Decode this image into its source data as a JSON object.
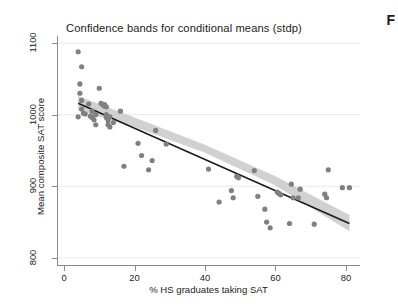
{
  "page": {
    "caption_fragment": "F"
  },
  "figure": {
    "title": "Confidence bands for conditional means (stdp)"
  },
  "chart_data": {
    "type": "scatter",
    "title": "Confidence bands for conditional means (stdp)",
    "xlabel": "% HS graduates taking SAT",
    "ylabel": "Mean composite SAT score",
    "xlim": [
      -2,
      84
    ],
    "ylim": [
      790,
      1110
    ],
    "xticks": [
      0,
      20,
      40,
      60,
      80
    ],
    "yticks": [
      800,
      900,
      1000,
      1100
    ],
    "xtick_labels": [
      "0",
      "20",
      "40",
      "60",
      "80"
    ],
    "ytick_labels": [
      "800",
      "900",
      "1000",
      "1100"
    ],
    "grid": "horizontal",
    "legend": "none",
    "marker_color": "#808080",
    "marker_size": 4,
    "fit_line_color": "#1a1a1a",
    "ci_band_color": "#c9c9c9",
    "gridline_color": "#e9e9e9",
    "axis_color": "#8a8a8a",
    "points": [
      [
        4.0,
        1088
      ],
      [
        5.0,
        1067
      ],
      [
        4.5,
        1043
      ],
      [
        4.5,
        1030
      ],
      [
        4.0,
        997
      ],
      [
        5.0,
        1020
      ],
      [
        5.0,
        1008
      ],
      [
        5.5,
        1002
      ],
      [
        6.0,
        1001
      ],
      [
        7.0,
        1015
      ],
      [
        7.5,
        998
      ],
      [
        8.0,
        1005
      ],
      [
        8.0,
        996
      ],
      [
        8.5,
        993
      ],
      [
        9.0,
        1000
      ],
      [
        9.0,
        986
      ],
      [
        10.0,
        1037
      ],
      [
        10.5,
        1016
      ],
      [
        11.0,
        1014
      ],
      [
        11.5,
        1014
      ],
      [
        11.5,
        1012
      ],
      [
        12.0,
        1011
      ],
      [
        12.0,
        1000
      ],
      [
        12.0,
        996
      ],
      [
        12.5,
        992
      ],
      [
        12.5,
        986
      ],
      [
        13.0,
        997
      ],
      [
        13.0,
        983
      ],
      [
        14.0,
        989
      ],
      [
        16.0,
        1005
      ],
      [
        17.0,
        928
      ],
      [
        21.0,
        960
      ],
      [
        22.0,
        943
      ],
      [
        24.0,
        923
      ],
      [
        25.0,
        936
      ],
      [
        26.0,
        978
      ],
      [
        29.0,
        959
      ],
      [
        41.0,
        924
      ],
      [
        44.0,
        878
      ],
      [
        47.5,
        894
      ],
      [
        48.0,
        884
      ],
      [
        49.0,
        914
      ],
      [
        49.5,
        912
      ],
      [
        54.0,
        922
      ],
      [
        55.0,
        886
      ],
      [
        57.0,
        868
      ],
      [
        57.5,
        850
      ],
      [
        58.5,
        842
      ],
      [
        60.5,
        892
      ],
      [
        61.0,
        890
      ],
      [
        61.5,
        888
      ],
      [
        64.0,
        848
      ],
      [
        64.5,
        903
      ],
      [
        65.0,
        884
      ],
      [
        66.5,
        884
      ],
      [
        67.0,
        896
      ],
      [
        71.0,
        847
      ],
      [
        74.0,
        889
      ],
      [
        74.5,
        884
      ],
      [
        75.0,
        923
      ],
      [
        79.0,
        898
      ],
      [
        81.0,
        898
      ]
    ],
    "fit_line": {
      "description": "linear fit of mean composite SAT score on % HS graduates taking SAT",
      "x_start": 4.0,
      "y_start": 1016,
      "x_end": 81.0,
      "y_end": 848
    },
    "ci_band": {
      "description": "confidence band for conditional means (stdp)",
      "lower": [
        [
          4.0,
          1006
        ],
        [
          20.0,
          983
        ],
        [
          40.0,
          947
        ],
        [
          60.0,
          901
        ],
        [
          81.0,
          837
        ]
      ],
      "upper": [
        [
          4.0,
          1026
        ],
        [
          20.0,
          996
        ],
        [
          40.0,
          958
        ],
        [
          60.0,
          914
        ],
        [
          81.0,
          860
        ]
      ]
    }
  }
}
